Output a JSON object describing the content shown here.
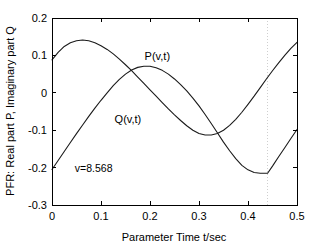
{
  "chart_data": {
    "type": "line",
    "title": "",
    "xlabel": "Parameter Time  t/sec",
    "ylabel": "PFR: Real part P, Imaginary part Q",
    "xlim": [
      0,
      0.5
    ],
    "ylim": [
      -0.3,
      0.2
    ],
    "xticks": [
      0,
      0.1,
      0.2,
      0.3,
      0.4,
      0.5
    ],
    "xticklabels": [
      "0",
      "0.1",
      "0.2",
      "0.3",
      "0.4",
      "0.5"
    ],
    "yticks": [
      -0.3,
      -0.2,
      -0.1,
      0,
      0.1,
      0.2
    ],
    "yticklabels": [
      "-0.3",
      "-0.2",
      "-0.1",
      "0",
      "0.1",
      "0.2"
    ],
    "grid": false,
    "legend_position": "inline-annotations",
    "annotations": [
      {
        "text": "P(v,t)",
        "x": 0.215,
        "y": 0.088
      },
      {
        "text": "Q(v,t)",
        "x": 0.155,
        "y": -0.082
      },
      {
        "text": "v=8.568",
        "x": 0.085,
        "y": -0.212
      }
    ],
    "marker_lines": [
      {
        "orientation": "vertical",
        "x": 0.44,
        "color": "#cfcfcf",
        "style": "dotted"
      }
    ],
    "series": [
      {
        "name": "P(v,t)",
        "label": "P(v,t)",
        "color": "#1a1a1a",
        "x": [
          0,
          0.0125,
          0.025,
          0.0375,
          0.05,
          0.0625,
          0.075,
          0.0875,
          0.1,
          0.1125,
          0.125,
          0.1375,
          0.15,
          0.1625,
          0.175,
          0.1875,
          0.2,
          0.2125,
          0.225,
          0.2375,
          0.25,
          0.2625,
          0.275,
          0.2875,
          0.3,
          0.3125,
          0.325,
          0.3375,
          0.35,
          0.3625,
          0.375,
          0.3875,
          0.4,
          0.4125,
          0.425,
          0.4375,
          0.45,
          0.4625,
          0.475,
          0.4875,
          0.5
        ],
        "y": [
          0.088,
          0.108,
          0.124,
          0.134,
          0.139,
          0.141,
          0.139,
          0.134,
          0.126,
          0.116,
          0.104,
          0.09,
          0.075,
          0.059,
          0.042,
          0.025,
          0.008,
          -0.009,
          -0.026,
          -0.043,
          -0.059,
          -0.074,
          -0.088,
          -0.1,
          -0.109,
          -0.113,
          -0.113,
          -0.109,
          -0.1,
          -0.087,
          -0.071,
          -0.052,
          -0.031,
          -0.009,
          0.014,
          0.037,
          0.059,
          0.08,
          0.1,
          0.119,
          0.135
        ]
      },
      {
        "name": "Q(v,t)",
        "label": "Q(v,t)",
        "color": "#1a1a1a",
        "x": [
          0,
          0.0125,
          0.025,
          0.0375,
          0.05,
          0.0625,
          0.075,
          0.0875,
          0.1,
          0.1125,
          0.125,
          0.1375,
          0.15,
          0.1625,
          0.175,
          0.1875,
          0.2,
          0.2125,
          0.225,
          0.2375,
          0.25,
          0.2625,
          0.275,
          0.2875,
          0.3,
          0.3125,
          0.325,
          0.3375,
          0.35,
          0.3625,
          0.375,
          0.3875,
          0.4,
          0.4125,
          0.425,
          0.4375,
          0.44,
          0.45,
          0.4625,
          0.475,
          0.4875,
          0.5
        ],
        "y": [
          -0.205,
          -0.181,
          -0.157,
          -0.133,
          -0.109,
          -0.086,
          -0.063,
          -0.041,
          -0.02,
          0.0,
          0.019,
          0.036,
          0.05,
          0.061,
          0.068,
          0.071,
          0.071,
          0.067,
          0.06,
          0.05,
          0.037,
          0.022,
          0.005,
          -0.014,
          -0.035,
          -0.058,
          -0.082,
          -0.107,
          -0.132,
          -0.155,
          -0.176,
          -0.194,
          -0.206,
          -0.213,
          -0.215,
          -0.215,
          -0.215,
          -0.196,
          -0.171,
          -0.147,
          -0.122,
          -0.098
        ]
      }
    ]
  }
}
